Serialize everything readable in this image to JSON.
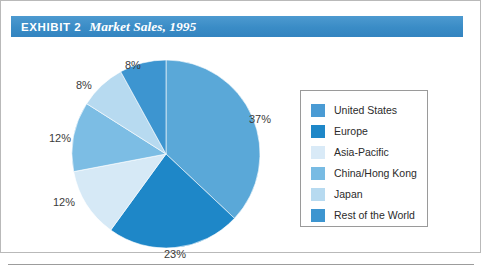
{
  "header": {
    "exhibit_label": "EXHIBIT 2",
    "title": "Market Sales, 1995",
    "bar_color": "#3d8fc9"
  },
  "chart_data": {
    "type": "pie",
    "title": "Market Sales, 1995",
    "xlabel": "",
    "ylabel": "",
    "legend_position": "right",
    "grid": false,
    "start_angle_deg": 90,
    "direction": "clockwise",
    "categories": [
      "United States",
      "Europe",
      "Asia-Pacific",
      "China/Hong Kong",
      "Japan",
      "Rest of the World"
    ],
    "values": [
      37,
      23,
      12,
      12,
      8,
      8
    ],
    "value_labels": [
      "37%",
      "23%",
      "12%",
      "12%",
      "8%",
      "8%"
    ],
    "unit": "percent",
    "colors": [
      "#5aa8d8",
      "#1e87c8",
      "#d6e9f6",
      "#7cbde4",
      "#b7daf0",
      "#3d95d0"
    ]
  },
  "pie": {
    "labels": [
      {
        "text": "37%",
        "left": 248,
        "top": 72
      },
      {
        "text": "23%",
        "left": 163,
        "top": 207
      },
      {
        "text": "12%",
        "left": 52,
        "top": 155
      },
      {
        "text": "12%",
        "left": 48,
        "top": 91
      },
      {
        "text": "8%",
        "left": 75,
        "top": 38
      },
      {
        "text": "8%",
        "left": 124,
        "top": 18
      }
    ]
  },
  "legend": {
    "items": [
      {
        "label": "United States",
        "color": "#4a9bd4"
      },
      {
        "label": "Europe",
        "color": "#1e87c8"
      },
      {
        "label": "Asia-Pacific",
        "color": "#d9eaf7"
      },
      {
        "label": "China/Hong Kong",
        "color": "#78bbe3"
      },
      {
        "label": "Japan",
        "color": "#b7daf0"
      },
      {
        "label": "Rest of the World",
        "color": "#3d95d0"
      }
    ]
  }
}
